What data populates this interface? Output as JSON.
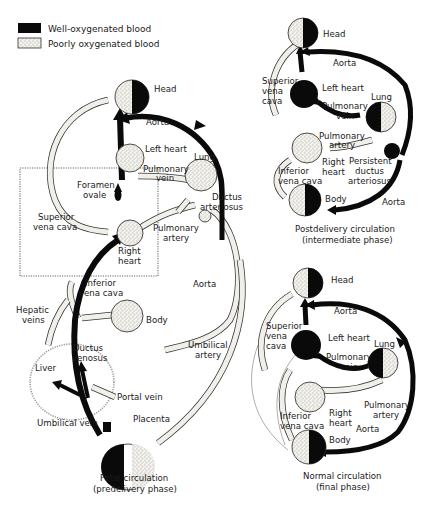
{
  "legend": {
    "items": [
      {
        "label": "Well-oxygenated blood",
        "swatch": "#0a0a0a"
      },
      {
        "label": "Poorly oxygenated blood",
        "swatch": "stippled"
      }
    ]
  },
  "fetal": {
    "labels": {
      "head": "Head",
      "aorta_top": "Aorta",
      "left_heart": "Left heart",
      "lung": "Lung",
      "pulmonary_vein_1": "Pulmonary",
      "pulmonary_vein_2": "vein",
      "foramen_ovale_1": "Foramen",
      "foramen_ovale_2": "ovale",
      "ductus_arteriosus_1": "Ductus",
      "ductus_arteriosus_2": "arteriosus",
      "superior_vena_cava_1": "Superior",
      "superior_vena_cava_2": "vena cava",
      "pulmonary_artery_1": "Pulmonary",
      "pulmonary_artery_2": "artery",
      "right_heart_1": "Right",
      "right_heart_2": "heart",
      "inferior_vena_cava_1": "Inferior",
      "inferior_vena_cava_2": "vena cava",
      "aorta_mid": "Aorta",
      "hepatic_veins_1": "Hepatic",
      "hepatic_veins_2": "veins",
      "body": "Body",
      "ductus_venosus_1": "Ductus",
      "ductus_venosus_2": "venosus",
      "umbilical_artery_1": "Umbilical",
      "umbilical_artery_2": "artery",
      "liver": "Liver",
      "portal_vein": "Portal vein",
      "placenta": "Placenta",
      "umbilical_vein": "Umbilical vein"
    },
    "caption": {
      "line1": "Fetal circulation",
      "line2": "(predelivery phase)"
    }
  },
  "postdelivery": {
    "labels": {
      "head": "Head",
      "aorta_top": "Aorta",
      "superior_vena_cava_1": "Superior",
      "superior_vena_cava_2": "vena",
      "superior_vena_cava_3": "cava",
      "left_heart": "Left heart",
      "lung": "Lung",
      "pulmonary_vein_1": "Pulmonary",
      "pulmonary_vein_2": "vein",
      "pulmonary_artery_1": "Pulmonary",
      "pulmonary_artery_2": "artery",
      "right_heart_1": "Right",
      "right_heart_2": "heart",
      "inferior_vena_cava_1": "Inferior",
      "inferior_vena_cava_2": "vena cava",
      "persistent_ductus_1": "Persistent",
      "persistent_ductus_2": "ductus",
      "persistent_ductus_3": "arteriosus",
      "body": "Body",
      "aorta_bottom": "Aorta"
    },
    "caption": {
      "line1": "Postdelivery circulation",
      "line2": "(intermediate phase)"
    }
  },
  "normal": {
    "labels": {
      "head": "Head",
      "aorta_top": "Aorta",
      "superior_vena_cava_1": "Superior",
      "superior_vena_cava_2": "vena",
      "superior_vena_cava_3": "cava",
      "left_heart": "Left heart",
      "lung": "Lung",
      "pulmonary_vein_1": "Pulmonary",
      "pulmonary_vein_2": "vein",
      "inferior_vena_cava_1": "Inferior",
      "inferior_vena_cava_2": "vena cava",
      "right_heart_1": "Right",
      "right_heart_2": "heart",
      "pulmonary_artery_1": "Pulmonary",
      "pulmonary_artery_2": "artery",
      "aorta_bottom": "Aorta",
      "body": "Body"
    },
    "caption": {
      "line1": "Normal circulation",
      "line2": "(final phase)"
    }
  }
}
